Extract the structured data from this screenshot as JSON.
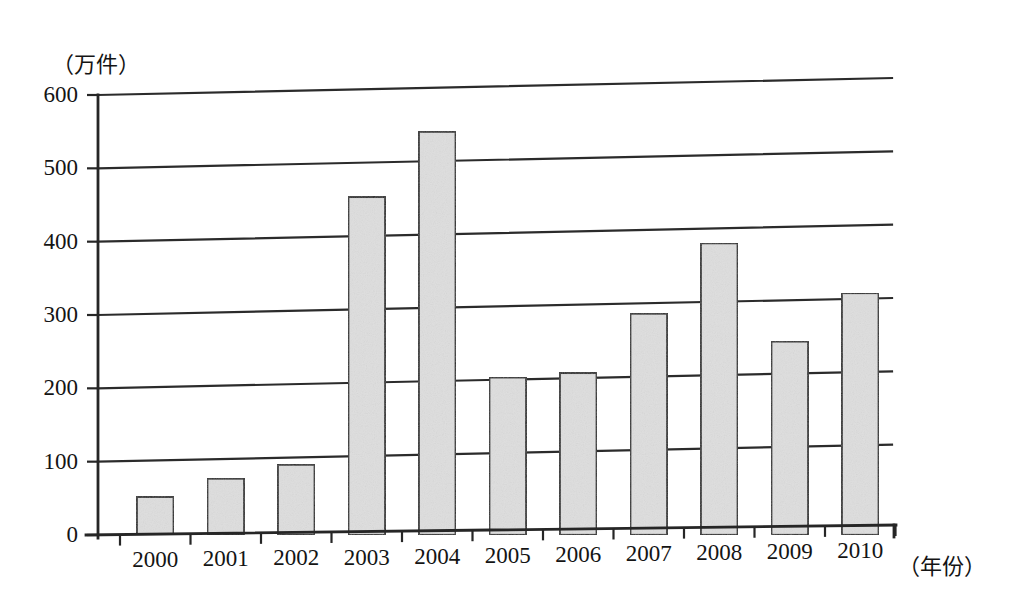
{
  "chart_data": {
    "type": "bar",
    "title": "",
    "subtitle": "",
    "xlabel": "（年份）",
    "ylabel": "（万件）",
    "categories": [
      "2000",
      "2001",
      "2002",
      "2003",
      "2004",
      "2005",
      "2006",
      "2007",
      "2008",
      "2009",
      "2010"
    ],
    "values": [
      52,
      77,
      96,
      461,
      550,
      215,
      221,
      302,
      398,
      264,
      330
    ],
    "ylim": [
      0,
      600
    ],
    "yticks": [
      0,
      100,
      200,
      300,
      400,
      500,
      600
    ],
    "ytick_labels": [
      "0",
      "100",
      "200",
      "300",
      "400",
      "500",
      "600"
    ],
    "grid": true,
    "grid_axis": "y",
    "legend": false,
    "legend_position": "none",
    "bar_fill_color": "#dedede",
    "bar_edge_color": "#2a2a2a",
    "axis_color": "#262626",
    "background_color": "#ffffff"
  },
  "axes": {
    "y_axis_unit_label": "（万件）",
    "x_axis_unit_label": "（年份）"
  }
}
